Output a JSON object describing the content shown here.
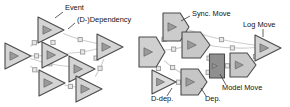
{
  "figure": {
    "background": "#ffffff",
    "width": 290,
    "height": 107
  },
  "colors": {
    "node_fill_light": "#d4d4d4",
    "node_fill_mid": "#c2c2c2",
    "node_fill_dark": "#8f8f8f",
    "node_stroke": "#4a4a4a",
    "glyph_fill": "#9a9a9a",
    "glyph_stroke": "#5a5a5a",
    "edge": "#cfcfcf",
    "connector_fill": "#e8e8e8",
    "connector_stroke": "#9a9a9a",
    "label_text": "#111111",
    "leader_line": "#3a3a3a"
  },
  "left_panel": {
    "name": "event-dependency-panel",
    "annotations": [
      {
        "id": "event",
        "label": "Event",
        "x": 65,
        "y": 10,
        "leader": {
          "x1": 63,
          "y1": 12,
          "x2": 55,
          "y2": 18
        }
      },
      {
        "id": "dependency",
        "label": "(D-)Dependency",
        "x": 77,
        "y": 22,
        "leader": {
          "x1": 75,
          "y1": 23,
          "x2": 68,
          "y2": 29
        }
      }
    ],
    "nodes": [
      {
        "id": "L-a",
        "shape": "triangle",
        "cx": 18,
        "cy": 56,
        "w": 26,
        "h": 26,
        "fill": "#d4d4d4"
      },
      {
        "id": "L-b",
        "shape": "triangle",
        "cx": 51,
        "cy": 30,
        "w": 26,
        "h": 26,
        "fill": "#d4d4d4"
      },
      {
        "id": "L-c",
        "shape": "triangle",
        "cx": 55,
        "cy": 55,
        "w": 26,
        "h": 26,
        "fill": "#d4d4d4"
      },
      {
        "id": "L-d",
        "shape": "triangle",
        "cx": 52,
        "cy": 83,
        "w": 26,
        "h": 26,
        "fill": "#d4d4d4"
      },
      {
        "id": "L-e",
        "shape": "triangle",
        "cx": 82,
        "cy": 69,
        "w": 26,
        "h": 26,
        "fill": "#d4d4d4"
      },
      {
        "id": "L-f",
        "shape": "triangle",
        "cx": 89,
        "cy": 89,
        "w": 26,
        "h": 26,
        "fill": "#d4d4d4"
      },
      {
        "id": "L-g",
        "shape": "triangle",
        "cx": 110,
        "cy": 47,
        "w": 26,
        "h": 26,
        "fill": "#d4d4d4"
      }
    ],
    "edges": [
      {
        "from": "L-b",
        "to": "L-a",
        "marker": true
      },
      {
        "from": "L-b",
        "to": "L-c",
        "marker": true
      },
      {
        "from": "L-b",
        "to": "L-g",
        "marker": true
      },
      {
        "from": "L-a",
        "to": "L-c",
        "marker": true
      },
      {
        "from": "L-a",
        "to": "L-d",
        "marker": true
      },
      {
        "from": "L-a",
        "to": "L-e",
        "marker": true
      },
      {
        "from": "L-c",
        "to": "L-g",
        "marker": true
      },
      {
        "from": "L-e",
        "to": "L-g",
        "marker": true
      },
      {
        "from": "L-d",
        "to": "L-f",
        "marker": true
      },
      {
        "from": "L-f",
        "to": "L-g",
        "marker": true
      }
    ]
  },
  "right_panel": {
    "name": "alignment-move-panel",
    "annotations": [
      {
        "id": "sync-move",
        "label": "Sync. Move",
        "x": 192,
        "y": 16,
        "leader": {
          "x1": 190,
          "y1": 16,
          "x2": 181,
          "y2": 21
        }
      },
      {
        "id": "log-move",
        "label": "Log Move",
        "x": 243,
        "y": 27,
        "leader": {
          "x1": 263,
          "y1": 29,
          "x2": 263,
          "y2": 37
        }
      },
      {
        "id": "model-move",
        "label": "Model Move",
        "x": 222,
        "y": 90,
        "leader": {
          "x1": 226,
          "y1": 85,
          "x2": 220,
          "y2": 74
        }
      },
      {
        "id": "dep",
        "label": "Dep.",
        "x": 205,
        "y": 101,
        "leader": {
          "x1": 206,
          "y1": 96,
          "x2": 201,
          "y2": 88
        }
      },
      {
        "id": "d-dep",
        "label": "D-dep.",
        "x": 151,
        "y": 101,
        "leader": {
          "x1": 167,
          "y1": 96,
          "x2": 172,
          "y2": 88
        }
      }
    ],
    "nodes": [
      {
        "id": "R-a",
        "shape": "pentagon",
        "cx": 152,
        "cy": 52,
        "w": 26,
        "h": 30,
        "fill": "#d0d0d0"
      },
      {
        "id": "R-b",
        "shape": "pentagon",
        "cx": 176,
        "cy": 27,
        "w": 26,
        "h": 28,
        "fill": "#cccccc"
      },
      {
        "id": "R-c",
        "shape": "pentagon",
        "cx": 196,
        "cy": 45,
        "w": 28,
        "h": 26,
        "fill": "#c8c8c8"
      },
      {
        "id": "R-d",
        "shape": "triangle",
        "cx": 164,
        "cy": 82,
        "w": 24,
        "h": 24,
        "fill": "#dcdcdc"
      },
      {
        "id": "R-e",
        "shape": "pentagon",
        "cx": 194,
        "cy": 82,
        "w": 26,
        "h": 26,
        "fill": "#c6c6c6"
      },
      {
        "id": "R-f",
        "shape": "rect",
        "cx": 217,
        "cy": 66,
        "w": 15,
        "h": 24,
        "fill": "#8f8f8f"
      },
      {
        "id": "R-g",
        "shape": "pentagon",
        "cx": 243,
        "cy": 65,
        "w": 26,
        "h": 24,
        "fill": "#c8c8c8"
      },
      {
        "id": "R-h",
        "shape": "triangle",
        "cx": 268,
        "cy": 48,
        "w": 26,
        "h": 26,
        "fill": "#d4d4d4"
      }
    ],
    "edges": [
      {
        "from": "R-a",
        "to": "R-b",
        "marker": true
      },
      {
        "from": "R-a",
        "to": "R-c",
        "marker": true
      },
      {
        "from": "R-a",
        "to": "R-d",
        "marker": true
      },
      {
        "from": "R-a",
        "to": "R-e",
        "marker": true
      },
      {
        "from": "R-b",
        "to": "R-c",
        "marker": true
      },
      {
        "from": "R-b",
        "to": "R-h",
        "marker": true
      },
      {
        "from": "R-c",
        "to": "R-f",
        "marker": true
      },
      {
        "from": "R-c",
        "to": "R-h",
        "marker": true
      },
      {
        "from": "R-d",
        "to": "R-e",
        "marker": true
      },
      {
        "from": "R-e",
        "to": "R-f",
        "marker": true
      },
      {
        "from": "R-f",
        "to": "R-g",
        "marker": true
      },
      {
        "from": "R-g",
        "to": "R-h",
        "marker": true
      }
    ]
  }
}
